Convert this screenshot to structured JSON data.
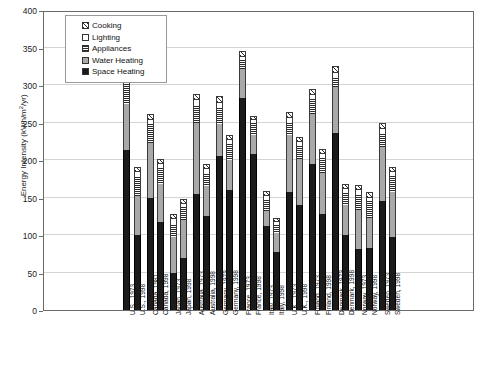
{
  "chart_data": {
    "type": "bar",
    "stacked": true,
    "title": "",
    "xlabel": "",
    "ylabel": "Energy Intensity (kWh/m2/yr)",
    "ylim": [
      0,
      400
    ],
    "yticks": [
      0,
      50,
      100,
      150,
      200,
      250,
      300,
      350,
      400
    ],
    "grid": true,
    "legend_position": "top-left",
    "categories": [
      "U.S., 1973",
      "U.S., 1998",
      "Canada, 1981",
      "Canada, 1998",
      "Japan, 1973",
      "Japan, 1998",
      "Australia, 1973",
      "Australia, 1998",
      "Germany, 1973",
      "Germany, 1998",
      "France, 1973",
      "France, 1998",
      "Italy, 1973",
      "Italy, 1998",
      "U.K., 1973",
      "U.K., 1998",
      "Finland, 1973",
      "Finland, 1998",
      "Denmark, 1973",
      "Denmark, 1998",
      "Norway, 1973",
      "Norway, 1998",
      "Sweden, 1973",
      "Sweden, 1998"
    ],
    "series": [
      {
        "name": "Space Heating",
        "values": [
          213,
          100,
          150,
          118,
          50,
          70,
          155,
          125,
          205,
          160,
          283,
          208,
          112,
          78,
          158,
          140,
          195,
          128,
          236,
          100,
          82,
          83,
          145,
          97
        ]
      },
      {
        "name": "Water Heating",
        "values": [
          62,
          52,
          73,
          50,
          47,
          50,
          95,
          40,
          43,
          40,
          39,
          25,
          20,
          25,
          75,
          62,
          67,
          55,
          62,
          40,
          52,
          40,
          73,
          60
        ]
      },
      {
        "name": "Appliances",
        "values": [
          32,
          26,
          25,
          22,
          17,
          17,
          22,
          17,
          22,
          22,
          11,
          16,
          15,
          10,
          17,
          17,
          19,
          20,
          12,
          16,
          20,
          22,
          17,
          22
        ]
      },
      {
        "name": "Lighting",
        "values": [
          9,
          6,
          6,
          5,
          7,
          5,
          8,
          6,
          6,
          5,
          5,
          4,
          5,
          4,
          6,
          5,
          6,
          5,
          6,
          5,
          6,
          5,
          6,
          5
        ]
      },
      {
        "name": "Cooking",
        "values": [
          10,
          7,
          7,
          6,
          7,
          6,
          8,
          7,
          9,
          7,
          7,
          6,
          7,
          6,
          8,
          7,
          8,
          7,
          9,
          7,
          7,
          7,
          8,
          7
        ]
      }
    ],
    "totals": [
      326,
      191,
      261,
      201,
      128,
      148,
      288,
      195,
      285,
      234,
      345,
      259,
      159,
      123,
      264,
      231,
      295,
      215,
      325,
      168,
      167,
      157,
      249,
      191
    ]
  },
  "legend": {
    "items": [
      {
        "label": "Cooking",
        "swatch": "cooking-swatch"
      },
      {
        "label": "Lighting",
        "swatch": "lighting-swatch"
      },
      {
        "label": "Appliances",
        "swatch": "appliances-swatch"
      },
      {
        "label": "Water Heating",
        "swatch": "water-heating-swatch"
      },
      {
        "label": "Space Heating",
        "swatch": "space-heating-swatch"
      }
    ]
  },
  "axis": {
    "y_title_main": "Energy Intensity (kWh/m",
    "y_title_sup": "2",
    "y_title_tail": "/yr)"
  }
}
